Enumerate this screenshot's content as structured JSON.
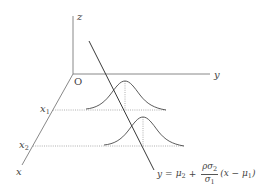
{
  "diagram": {
    "type": "3d-conditional-normal-illustration",
    "axes": {
      "origin_label": "O",
      "x_label": "x",
      "y_label": "y",
      "z_label": "z"
    },
    "ticks": {
      "x1": {
        "base": "x",
        "sub": "1"
      },
      "x2": {
        "base": "x",
        "sub": "2"
      }
    },
    "regression_line_formula": {
      "lhs": "y",
      "eq": "=",
      "mu2": "μ",
      "mu2_sub": "2",
      "plus": "+",
      "numerator": "ρσ",
      "numerator_sub": "2",
      "denominator": "σ",
      "denominator_sub": "1",
      "tail_open": "(x − μ",
      "tail_sub": "1",
      "tail_close": ")"
    },
    "curves": [
      {
        "name": "conditional-density-at-x1",
        "peak": [
          125,
          81
        ],
        "baseline_y": 110
      },
      {
        "name": "conditional-density-at-x2",
        "peak": [
          143,
          117
        ],
        "baseline_y": 146
      }
    ],
    "colors": {
      "axis": "#7a7a7a",
      "curve": "#4a4a4a",
      "regression_line": "#3a3a3a",
      "dotted": "#9a9a9a",
      "text": "#444444"
    }
  }
}
